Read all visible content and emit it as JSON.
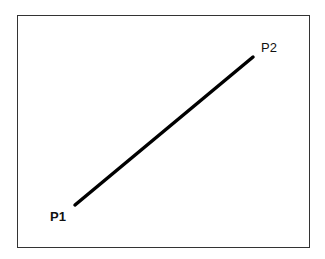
{
  "diagram": {
    "type": "line-segment",
    "points": [
      {
        "id": "P1",
        "label": "P1"
      },
      {
        "id": "P2",
        "label": "P2"
      }
    ],
    "colors": {
      "line": "#000000",
      "frame": "#333333",
      "background": "#ffffff"
    }
  }
}
